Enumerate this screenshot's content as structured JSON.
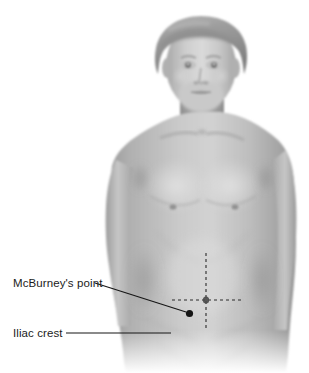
{
  "figure": {
    "type": "anatomical-illustration",
    "background_color": "#ffffff",
    "skin_tone": "#b9b9b9",
    "line_color": "#1b1b1b",
    "width": 309,
    "height": 373
  },
  "annotations": {
    "mcburney": {
      "label": "McBurney's point",
      "marker": "filled-dot",
      "marker_color": "#151515",
      "marker_x": 189.5,
      "marker_y": 313.5,
      "leader_from_x": 95,
      "leader_from_y": 283,
      "leader_to_x": 186,
      "leader_to_y": 312
    },
    "iliac": {
      "label": "Iliac crest",
      "leader_from_x": 66,
      "leader_from_y": 333,
      "leader_to_x": 171,
      "leader_to_y": 333
    },
    "midline": {
      "name": "vertical-midline",
      "style": "dashed",
      "x": 206,
      "y_start": 253,
      "y_end": 328
    },
    "transumbilical": {
      "name": "horizontal-umbilical-line",
      "style": "dashed",
      "y": 300,
      "x_start": 172,
      "x_end": 242
    },
    "umbilicus": {
      "name": "navel",
      "x": 206,
      "y": 300
    }
  }
}
